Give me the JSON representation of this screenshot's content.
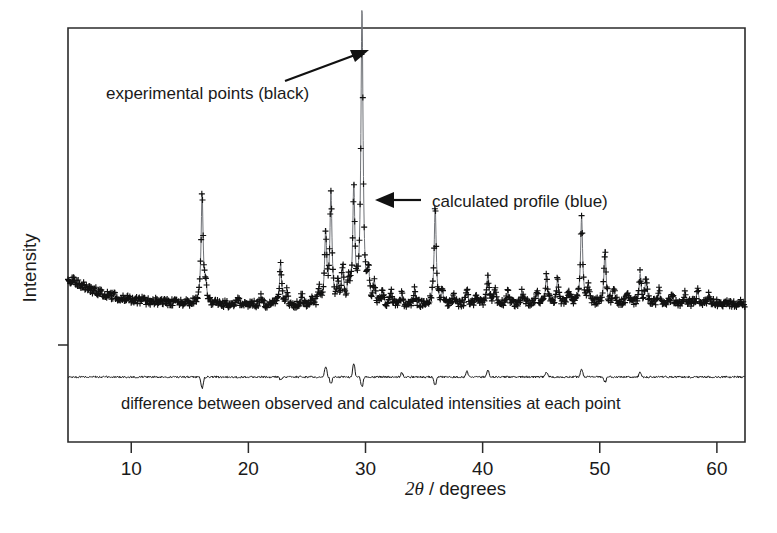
{
  "figure": {
    "kind": "xrd-rietveld-refinement-plot",
    "background_color": "#ffffff",
    "frame_color": "#2b2b2b"
  },
  "annotations": {
    "experimental_points": "experimental points (black)",
    "calculated_profile": "calculated profile (blue)",
    "difference_caption": "difference between observed and calculated intensities at each point"
  },
  "axes": {
    "x_label_number": "2",
    "x_label_symbol": "θ",
    "x_label_rest": " / degrees",
    "x_label_full": "2θ / degrees",
    "y_label": "Intensity",
    "x_ticks": [
      10,
      20,
      30,
      40,
      50,
      60
    ],
    "x_tick_labels": [
      "10",
      "20",
      "30",
      "40",
      "50",
      "60"
    ]
  },
  "chart_data": {
    "type": "line",
    "title": "",
    "xlabel": "2θ / degrees",
    "ylabel": "Intensity",
    "xlim": [
      4.6,
      62.4
    ],
    "ylim": [
      0,
      100
    ],
    "grid": false,
    "legend_position": "inline-annotations",
    "series": [
      {
        "name": "experimental points (black)",
        "style": "plus-markers",
        "color": "#111111"
      },
      {
        "name": "calculated profile (blue)",
        "style": "line",
        "color": "#6f7277"
      },
      {
        "name": "difference between observed and calculated intensities at each point",
        "style": "line",
        "color": "#1a1a1a",
        "baseline_y": 9.5
      }
    ],
    "background_profile": {
      "comment": "smooth decaying background, intensity units, sampled every 0.5 deg from 5 to 60",
      "x_start": 5.0,
      "x_step": 0.5,
      "values": [
        20.5,
        19.4,
        18.4,
        17.5,
        16.8,
        16.2,
        15.7,
        15.3,
        14.9,
        14.6,
        14.3,
        14.1,
        13.9,
        13.7,
        13.6,
        13.4,
        13.3,
        13.2,
        13.1,
        13.0,
        12.9,
        12.9,
        12.8,
        12.8,
        12.7,
        12.7,
        12.6,
        12.6,
        12.6,
        12.5,
        12.5,
        12.5,
        12.4,
        12.4,
        12.4,
        12.4,
        12.3,
        12.3,
        12.3,
        12.3,
        12.3,
        12.2,
        12.2,
        12.2,
        12.2,
        12.2,
        12.2,
        12.2,
        12.2,
        12.2,
        12.2,
        12.2,
        12.2,
        12.2,
        12.2,
        12.3,
        12.3,
        12.3,
        12.3,
        12.4,
        12.4,
        12.4,
        12.5,
        12.5,
        12.5,
        12.6,
        12.6,
        12.6,
        12.7,
        12.7,
        12.7,
        12.8,
        12.8,
        12.8,
        12.9,
        12.9,
        12.9,
        13.0,
        13.0,
        13.0,
        13.0,
        13.0,
        13.0,
        13.0,
        13.0,
        13.0,
        13.0,
        13.0,
        13.0,
        13.0,
        13.0,
        13.0,
        13.0,
        13.0,
        13.0,
        13.0,
        13.0,
        13.0,
        13.0,
        13.0,
        13.0,
        13.0,
        13.0,
        13.0,
        13.0,
        13.0,
        13.0,
        13.0,
        13.0,
        13.0,
        13.0
      ]
    },
    "peaks": [
      {
        "two_theta": 16.05,
        "height": 34.0,
        "width": 0.105
      },
      {
        "two_theta": 16.35,
        "height": 5.5,
        "width": 0.1
      },
      {
        "two_theta": 19.15,
        "height": 2.0,
        "width": 0.1
      },
      {
        "two_theta": 21.05,
        "height": 2.6,
        "width": 0.1
      },
      {
        "two_theta": 22.75,
        "height": 13.0,
        "width": 0.1
      },
      {
        "two_theta": 23.3,
        "height": 4.0,
        "width": 0.1
      },
      {
        "two_theta": 24.55,
        "height": 3.0,
        "width": 0.1
      },
      {
        "two_theta": 25.45,
        "height": 2.6,
        "width": 0.1
      },
      {
        "two_theta": 26.05,
        "height": 4.5,
        "width": 0.1
      },
      {
        "two_theta": 26.6,
        "height": 22.0,
        "width": 0.105
      },
      {
        "two_theta": 27.05,
        "height": 34.5,
        "width": 0.105
      },
      {
        "two_theta": 27.65,
        "height": 7.0,
        "width": 0.1
      },
      {
        "two_theta": 28.05,
        "height": 11.5,
        "width": 0.1
      },
      {
        "two_theta": 28.55,
        "height": 7.5,
        "width": 0.1
      },
      {
        "two_theta": 29.0,
        "height": 36.0,
        "width": 0.105
      },
      {
        "two_theta": 29.7,
        "height": 92.0,
        "width": 0.11
      },
      {
        "two_theta": 30.25,
        "height": 9.5,
        "width": 0.1
      },
      {
        "two_theta": 30.75,
        "height": 6.5,
        "width": 0.1
      },
      {
        "two_theta": 31.45,
        "height": 5.0,
        "width": 0.1
      },
      {
        "two_theta": 32.2,
        "height": 4.5,
        "width": 0.1
      },
      {
        "two_theta": 33.1,
        "height": 3.2,
        "width": 0.1
      },
      {
        "two_theta": 34.2,
        "height": 4.8,
        "width": 0.1
      },
      {
        "two_theta": 35.95,
        "height": 30.5,
        "width": 0.105
      },
      {
        "two_theta": 36.55,
        "height": 4.0,
        "width": 0.1
      },
      {
        "two_theta": 37.55,
        "height": 3.0,
        "width": 0.1
      },
      {
        "two_theta": 38.65,
        "height": 4.5,
        "width": 0.1
      },
      {
        "two_theta": 39.45,
        "height": 3.5,
        "width": 0.1
      },
      {
        "two_theta": 40.45,
        "height": 9.5,
        "width": 0.1
      },
      {
        "two_theta": 41.05,
        "height": 4.5,
        "width": 0.1
      },
      {
        "two_theta": 42.15,
        "height": 3.2,
        "width": 0.1
      },
      {
        "two_theta": 43.35,
        "height": 3.5,
        "width": 0.1
      },
      {
        "two_theta": 44.65,
        "height": 3.0,
        "width": 0.1
      },
      {
        "two_theta": 45.45,
        "height": 9.0,
        "width": 0.1
      },
      {
        "two_theta": 46.4,
        "height": 7.5,
        "width": 0.1
      },
      {
        "two_theta": 47.35,
        "height": 4.5,
        "width": 0.1
      },
      {
        "two_theta": 48.45,
        "height": 27.0,
        "width": 0.105
      },
      {
        "two_theta": 49.05,
        "height": 5.0,
        "width": 0.1
      },
      {
        "two_theta": 50.45,
        "height": 17.0,
        "width": 0.1
      },
      {
        "two_theta": 51.2,
        "height": 4.5,
        "width": 0.1
      },
      {
        "two_theta": 52.35,
        "height": 3.5,
        "width": 0.1
      },
      {
        "two_theta": 53.45,
        "height": 9.0,
        "width": 0.1
      },
      {
        "two_theta": 53.95,
        "height": 8.0,
        "width": 0.1
      },
      {
        "two_theta": 55.05,
        "height": 4.5,
        "width": 0.1
      },
      {
        "two_theta": 56.15,
        "height": 3.0,
        "width": 0.1
      },
      {
        "two_theta": 57.25,
        "height": 3.5,
        "width": 0.1
      },
      {
        "two_theta": 58.35,
        "height": 4.5,
        "width": 0.1
      },
      {
        "two_theta": 59.35,
        "height": 3.0,
        "width": 0.1
      }
    ],
    "difference_spikes": [
      {
        "two_theta": 16.05,
        "amplitude": -7.0
      },
      {
        "two_theta": 22.75,
        "amplitude": -2.0
      },
      {
        "two_theta": 26.6,
        "amplitude": 6.5
      },
      {
        "two_theta": 27.05,
        "amplitude": -4.5
      },
      {
        "two_theta": 29.0,
        "amplitude": 8.0
      },
      {
        "two_theta": 29.7,
        "amplitude": -6.0
      },
      {
        "two_theta": 33.1,
        "amplitude": 2.5
      },
      {
        "two_theta": 35.95,
        "amplitude": -5.0
      },
      {
        "two_theta": 38.65,
        "amplitude": 3.5
      },
      {
        "two_theta": 40.45,
        "amplitude": 4.0
      },
      {
        "two_theta": 45.45,
        "amplitude": 3.0
      },
      {
        "two_theta": 48.45,
        "amplitude": 4.5
      },
      {
        "two_theta": 50.45,
        "amplitude": -3.0
      },
      {
        "two_theta": 53.45,
        "amplitude": 3.0
      }
    ]
  }
}
